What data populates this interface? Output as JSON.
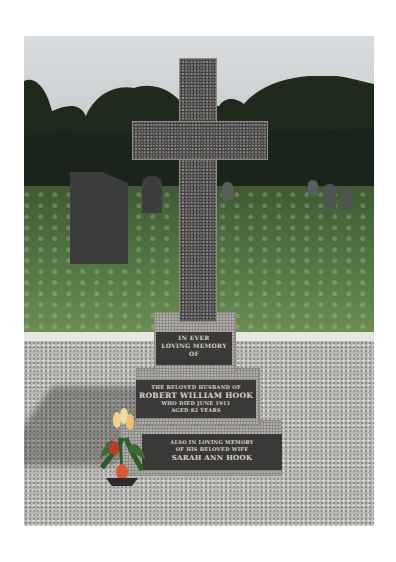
{
  "scene": {
    "subject": "Granite cross grave memorial in a churchyard",
    "colors": {
      "sky": "#d3d6d8",
      "trees": "#1f2a1c",
      "grass": "#577a45",
      "granite_dark": "#6c6966",
      "base_stone": "#b1aea9",
      "inscription_panel": "#3b3937",
      "gravel": "#b7b5b0",
      "tulip_red": "#c0392b",
      "tulip_yellow": "#f1d28a"
    }
  },
  "inscription": {
    "panel_top": {
      "line1": "IN EVER",
      "line2": "LOVING MEMORY",
      "line3": "OF"
    },
    "panel_middle": {
      "line1": "THE BELOVED HUSBAND OF",
      "line2": "ROBERT WILLIAM HOOK",
      "line3": "WHO DIED JUNE 1911",
      "line4": "AGED 82 YEARS"
    },
    "panel_bottom": {
      "line1": "ALSO IN LOVING MEMORY",
      "line2": "OF HIS BELOVED WIFE",
      "line3": "SARAH ANN HOOK"
    }
  }
}
